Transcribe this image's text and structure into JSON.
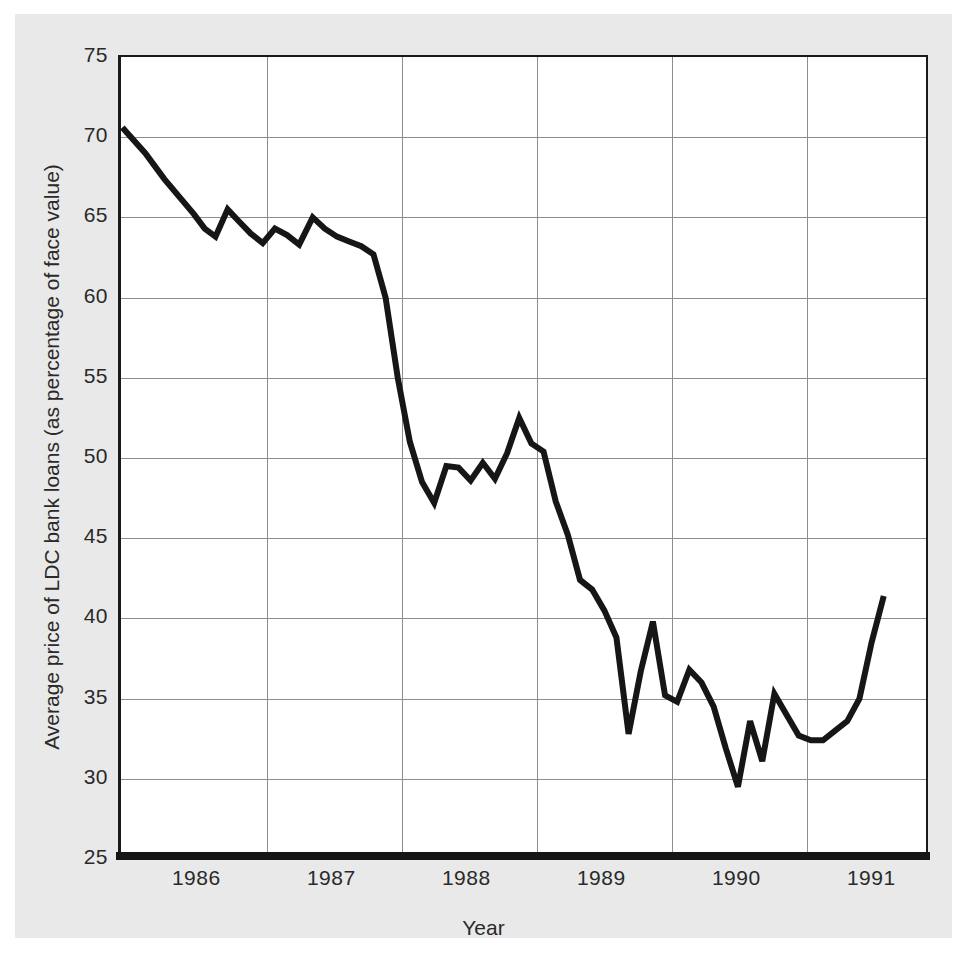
{
  "figure": {
    "background_color": "#e9e9e9",
    "plot_background_color": "#ffffff",
    "line_color": "#161616",
    "grid_color": "#8d8d8d",
    "axis_color": "#161616"
  },
  "chart_data": {
    "type": "line",
    "title": "",
    "xlabel": "Year",
    "ylabel": "Average price of LDC bank loans (as percentage of face value)",
    "xlim": [
      1985.42,
      1991.42
    ],
    "ylim": [
      25,
      75
    ],
    "grid": true,
    "legend": null,
    "ytick_labels": [
      "75",
      "70",
      "65",
      "60",
      "55",
      "50",
      "45",
      "40",
      "35",
      "30",
      "25"
    ],
    "ytick_values": [
      75,
      70,
      65,
      60,
      55,
      50,
      45,
      40,
      35,
      30,
      25
    ],
    "xtick_labels": [
      "1986",
      "1987",
      "1988",
      "1989",
      "1990",
      "1991"
    ],
    "xtick_values": [
      1986,
      1987,
      1988,
      1989,
      1990,
      1991
    ],
    "x_gridline_values": [
      1986.5,
      1987.5,
      1988.5,
      1989.5,
      1990.5
    ],
    "series": [
      {
        "name": "Average price of LDC bank loans",
        "x": [
          1985.43,
          1985.6,
          1985.74,
          1985.86,
          1985.96,
          1986.04,
          1986.12,
          1986.21,
          1986.3,
          1986.38,
          1986.47,
          1986.56,
          1986.65,
          1986.74,
          1986.84,
          1986.93,
          1987.02,
          1987.11,
          1987.2,
          1987.29,
          1987.38,
          1987.47,
          1987.56,
          1987.65,
          1987.74,
          1987.83,
          1987.92,
          1988.01,
          1988.1,
          1988.19,
          1988.28,
          1988.37,
          1988.46,
          1988.55,
          1988.64,
          1988.73,
          1988.82,
          1988.91,
          1989.0,
          1989.09,
          1989.18,
          1989.27,
          1989.36,
          1989.45,
          1989.54,
          1989.63,
          1989.72,
          1989.81,
          1989.9,
          1989.99,
          1990.08,
          1990.17,
          1990.26,
          1990.35,
          1990.44,
          1990.53,
          1990.62,
          1990.71,
          1990.8,
          1990.89,
          1990.98,
          1991.07
        ],
        "y": [
          70.6,
          69.0,
          67.4,
          66.2,
          65.2,
          64.3,
          63.8,
          65.5,
          64.7,
          64.0,
          63.4,
          64.3,
          63.9,
          63.3,
          65.0,
          64.3,
          63.8,
          63.5,
          63.2,
          62.7,
          60.0,
          55.0,
          51.0,
          48.5,
          47.2,
          49.5,
          49.4,
          48.6,
          49.7,
          48.7,
          50.3,
          52.5,
          50.9,
          50.4,
          47.3,
          45.2,
          42.4,
          41.8,
          40.5,
          38.8,
          32.8,
          36.7,
          39.8,
          35.2,
          34.8,
          36.8,
          36.0,
          34.5,
          31.9,
          29.5,
          33.6,
          31.1,
          35.3,
          34.0,
          32.7,
          32.4,
          32.4,
          33.0,
          33.6,
          35.0,
          38.5,
          41.4
        ]
      }
    ]
  }
}
